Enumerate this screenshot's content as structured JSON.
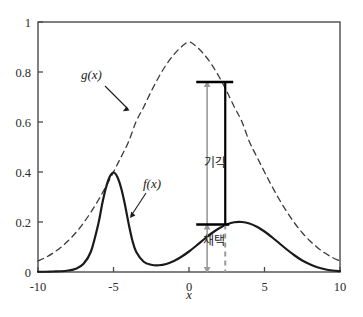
{
  "chart_data": {
    "type": "line",
    "title": "",
    "xlabel": "x",
    "ylabel": "",
    "xlim": [
      -10,
      10
    ],
    "ylim": [
      0,
      1
    ],
    "grid": false,
    "legend": "none",
    "xticks": [
      -10,
      -5,
      0,
      5,
      10
    ],
    "xtick_labels": [
      "-10",
      "-5",
      "0",
      "5",
      "10"
    ],
    "yticks": [
      0,
      0.2,
      0.4,
      0.6,
      0.8,
      1
    ],
    "ytick_labels": [
      "0",
      "0.2",
      "0.4",
      "0.6",
      "0.8",
      "1"
    ],
    "series": [
      {
        "name": "f(x)",
        "style": "solid",
        "color": "#1a1a1a",
        "description": "bimodal target density: narrow peak 0.40 at x=-5, broad peak 0.20 at x=3",
        "x": [
          -10,
          -9.5,
          -9,
          -8.5,
          -8,
          -7.5,
          -7,
          -6.5,
          -6,
          -5.75,
          -5.5,
          -5.25,
          -5,
          -4.75,
          -4.5,
          -4.25,
          -4,
          -3.75,
          -3.5,
          -3,
          -2.5,
          -2,
          -1.5,
          -1,
          -0.5,
          0,
          0.5,
          1,
          1.5,
          2,
          2.5,
          3,
          3.5,
          4,
          4.5,
          5,
          5.5,
          6,
          6.5,
          7,
          7.5,
          8,
          8.5,
          9,
          9.5,
          10
        ],
        "y": [
          0.001,
          0.001,
          0.002,
          0.003,
          0.006,
          0.013,
          0.032,
          0.081,
          0.194,
          0.272,
          0.337,
          0.381,
          0.398,
          0.381,
          0.337,
          0.272,
          0.194,
          0.126,
          0.081,
          0.041,
          0.029,
          0.027,
          0.032,
          0.044,
          0.061,
          0.082,
          0.106,
          0.131,
          0.155,
          0.175,
          0.19,
          0.199,
          0.2,
          0.194,
          0.181,
          0.162,
          0.139,
          0.114,
          0.089,
          0.066,
          0.046,
          0.031,
          0.019,
          0.011,
          0.006,
          0.003
        ]
      },
      {
        "name": "g(x)",
        "style": "dashed",
        "color": "#3a3a3a",
        "description": "proposal density: unimodal peak 0.92 at x=0",
        "x": [
          -10,
          -9.5,
          -9,
          -8.5,
          -8,
          -7.5,
          -7,
          -6.5,
          -6,
          -5.5,
          -5,
          -4.5,
          -4,
          -3.5,
          -3,
          -2.5,
          -2,
          -1.5,
          -1,
          -0.5,
          0,
          0.5,
          1,
          1.5,
          2,
          2.5,
          3,
          3.5,
          4,
          4.5,
          5,
          5.5,
          6,
          6.5,
          7,
          7.5,
          8,
          8.5,
          9,
          9.5,
          10
        ],
        "y": [
          0.044,
          0.058,
          0.076,
          0.098,
          0.125,
          0.157,
          0.195,
          0.239,
          0.288,
          0.342,
          0.4,
          0.46,
          0.521,
          0.602,
          0.66,
          0.723,
          0.78,
          0.83,
          0.87,
          0.901,
          0.92,
          0.901,
          0.87,
          0.83,
          0.78,
          0.723,
          0.66,
          0.602,
          0.521,
          0.46,
          0.4,
          0.342,
          0.288,
          0.239,
          0.195,
          0.157,
          0.125,
          0.098,
          0.076,
          0.058,
          0.044
        ]
      }
    ],
    "annotations": {
      "fn_label_g": "g(x)",
      "fn_label_f": "f(x)",
      "reject_label": "기각",
      "accept_label": "채택",
      "sample_x": 2.4,
      "g_at_sample": 0.76,
      "f_at_sample": 0.19,
      "arrow_x": 1.2,
      "reject_band": [
        0.19,
        0.76
      ],
      "accept_band": [
        0.0,
        0.19
      ]
    },
    "colors": {
      "f_curve": "#1a1a1a",
      "g_curve": "#3a3a3a",
      "axis": "#4a4a4a",
      "marker": "#000000",
      "guide": "#9a9a9a"
    }
  }
}
